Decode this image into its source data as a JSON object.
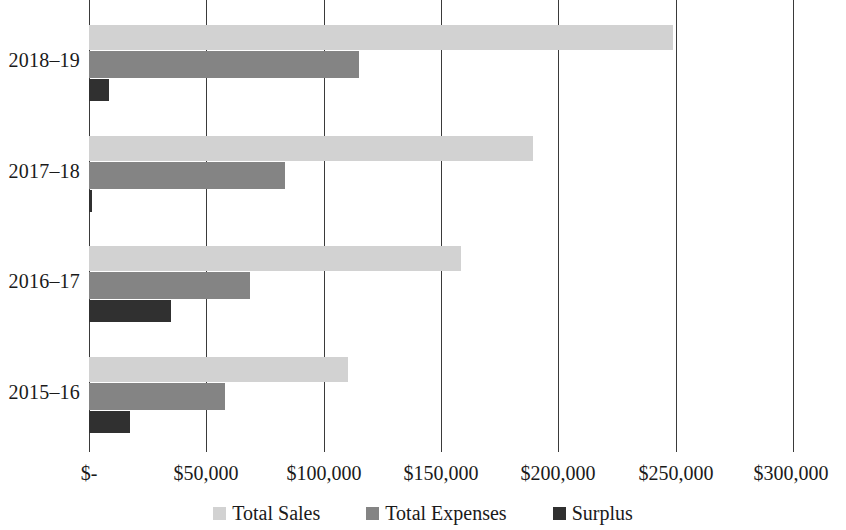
{
  "chart_data": {
    "type": "bar",
    "orientation": "horizontal",
    "title": "",
    "subtitle": "",
    "xlabel": "",
    "ylabel": "",
    "categories": [
      "2018–19",
      "2017–18",
      "2016–17",
      "2015–16"
    ],
    "series": [
      {
        "name": "Total Sales",
        "color": "#d2d2d2",
        "values": [
          249000,
          189000,
          158500,
          110500
        ]
      },
      {
        "name": "Total Expenses",
        "color": "#848484",
        "values": [
          115000,
          83500,
          68500,
          58000
        ]
      },
      {
        "name": "Surplus",
        "color": "#303030",
        "values": [
          8500,
          1300,
          35000,
          17500
        ]
      }
    ],
    "xlim": [
      0,
      300000
    ],
    "x_ticks": [
      0,
      50000,
      100000,
      150000,
      200000,
      250000,
      300000
    ],
    "x_tick_labels": [
      "$-",
      "$50,000",
      "$100,000",
      "$150,000",
      "$200,000",
      "$250,000",
      "$300,000"
    ],
    "grid": "vertical",
    "legend_position": "bottom",
    "legend_entries": [
      "Total Sales",
      "Total Expenses",
      "Surplus"
    ]
  }
}
